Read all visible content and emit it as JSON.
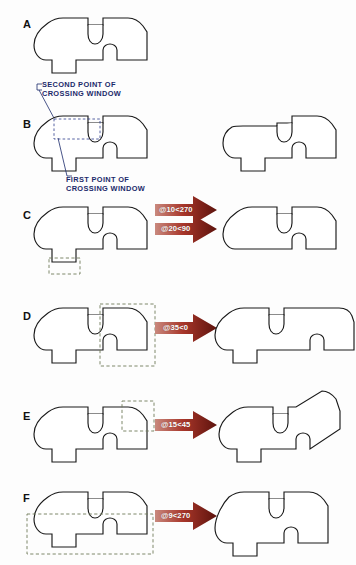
{
  "figure": {
    "ink_color": "#1a1a1a",
    "annotation_color": "#1b2a6b",
    "selection_box_color": "#6f7a5a",
    "arrow_color_dark": "#7a1b14",
    "arrow_color_light": "#c46a5c"
  },
  "annotations": {
    "second_point": "SECOND POINT OF\nCROSSING WINDOW",
    "first_point": "FIRST POINT OF\nCROSSING WINDOW"
  },
  "panels": [
    {
      "label": "A",
      "arrow_label": "",
      "has_arrow": false,
      "has_result": false,
      "has_selection": false,
      "description": "original part outline"
    },
    {
      "label": "B",
      "arrow_label": "@10<270",
      "has_arrow": true,
      "has_result": true,
      "has_selection": true,
      "description": "crossing window at upper-left notch, stretch down 10"
    },
    {
      "label": "C",
      "arrow_label": "@20<90",
      "has_arrow": true,
      "has_result": true,
      "has_selection": true,
      "description": "crossing window at bottom tab, stretch up 20"
    },
    {
      "label": "D",
      "arrow_label": "@35<0",
      "has_arrow": true,
      "has_result": true,
      "has_selection": true,
      "description": "crossing window at right end, stretch right 35"
    },
    {
      "label": "E",
      "arrow_label": "@15<45",
      "has_arrow": true,
      "has_result": true,
      "has_selection": true,
      "description": "crossing window at upper-right corner, stretch 15 at 45 degrees"
    },
    {
      "label": "F",
      "arrow_label": "@9<270",
      "has_arrow": true,
      "has_result": true,
      "has_selection": true,
      "description": "wide crossing window across lower half, stretch down 9"
    }
  ]
}
